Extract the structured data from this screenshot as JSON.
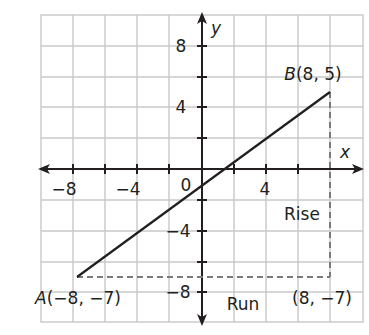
{
  "diagram": {
    "type": "coordinate-plane-slope",
    "axes": {
      "x_label": "x",
      "y_label": "y",
      "x_ticks": [
        {
          "value": -8,
          "label": "−8"
        },
        {
          "value": -4,
          "label": "−4"
        },
        {
          "value": 4,
          "label": "4"
        }
      ],
      "y_ticks": [
        {
          "value": 8,
          "label": "8"
        },
        {
          "value": 4,
          "label": "4"
        },
        {
          "value": -4,
          "label": "−4"
        },
        {
          "value": -8,
          "label": "−8"
        }
      ],
      "origin_label": "0",
      "grid_spacing": 2,
      "x_range": [
        -10,
        10
      ],
      "y_range": [
        -10,
        10
      ]
    },
    "points": {
      "A": {
        "label": "A(−8, −7)",
        "name": "A",
        "coords": "(−8, −7)",
        "x": -8,
        "y": -7
      },
      "B": {
        "label": "B(8, 5)",
        "name": "B",
        "coords": "(8, 5)",
        "x": 8,
        "y": 5
      },
      "C": {
        "label": "(8, −7)",
        "x": 8,
        "y": -7
      }
    },
    "segment": {
      "from": "A",
      "to": "B"
    },
    "annotations": {
      "rise": "Rise",
      "run": "Run"
    },
    "colors": {
      "grid": "#c8c8c8",
      "axis": "#231f20",
      "line": "#231f20",
      "dashed": "#7a7a7a"
    }
  }
}
